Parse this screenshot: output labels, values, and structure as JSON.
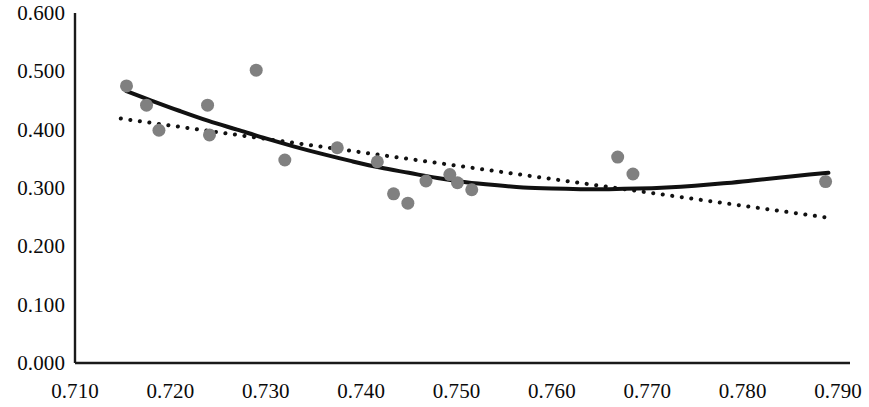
{
  "chart_data": {
    "type": "scatter",
    "title": "",
    "subtitle": "",
    "xlabel": "",
    "ylabel": "",
    "xlim": [
      0.71,
      0.79
    ],
    "ylim": [
      0.0,
      0.6
    ],
    "grid": false,
    "legend": "none",
    "x_ticks": [
      "0.710",
      "0.720",
      "0.730",
      "0.740",
      "0.750",
      "0.760",
      "0.770",
      "0.780",
      "0.790"
    ],
    "y_ticks": [
      "0.000",
      "0.100",
      "0.200",
      "0.300",
      "0.400",
      "0.500",
      "0.600"
    ],
    "x_tick_values": [
      0.71,
      0.72,
      0.73,
      0.74,
      0.75,
      0.76,
      0.77,
      0.78,
      0.79
    ],
    "y_tick_values": [
      0.0,
      0.1,
      0.2,
      0.3,
      0.4,
      0.5,
      0.6
    ],
    "marker_color": "#808080",
    "marker_size": 13,
    "axis_color": "#1a1a1a",
    "series": [
      {
        "name": "data-points",
        "type": "scatter",
        "color": "#808080",
        "x": [
          0.7154,
          0.7175,
          0.7188,
          0.7239,
          0.7241,
          0.729,
          0.732,
          0.7375,
          0.7417,
          0.7434,
          0.7449,
          0.7468,
          0.7493,
          0.7501,
          0.7516,
          0.7669,
          0.7685,
          0.7887
        ],
        "y": [
          0.475,
          0.442,
          0.399,
          0.442,
          0.391,
          0.502,
          0.348,
          0.369,
          0.345,
          0.29,
          0.274,
          0.312,
          0.323,
          0.309,
          0.297,
          0.353,
          0.324,
          0.311
        ]
      },
      {
        "name": "polynomial-trendline",
        "type": "line",
        "style": "solid",
        "color": "#111111",
        "width": 4,
        "x": [
          0.7154,
          0.718,
          0.721,
          0.724,
          0.727,
          0.73,
          0.733,
          0.736,
          0.739,
          0.742,
          0.745,
          0.748,
          0.751,
          0.754,
          0.757,
          0.76,
          0.763,
          0.766,
          0.769,
          0.772,
          0.775,
          0.778,
          0.781,
          0.784,
          0.787,
          0.789
        ],
        "y": [
          0.466,
          0.45,
          0.432,
          0.415,
          0.4,
          0.385,
          0.371,
          0.358,
          0.346,
          0.335,
          0.326,
          0.317,
          0.31,
          0.305,
          0.301,
          0.299,
          0.298,
          0.298,
          0.299,
          0.301,
          0.304,
          0.308,
          0.313,
          0.318,
          0.323,
          0.326
        ]
      },
      {
        "name": "linear-trendline",
        "type": "line",
        "style": "dotted",
        "color": "#111111",
        "width": 4,
        "x": [
          0.7148,
          0.789
        ],
        "y": [
          0.419,
          0.249
        ]
      }
    ]
  },
  "axes": {
    "x_axis_name": "x-axis",
    "y_axis_name": "y-axis"
  }
}
